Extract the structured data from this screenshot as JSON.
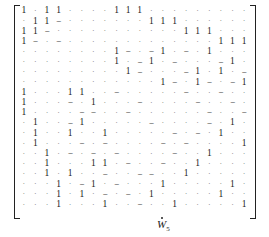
{
  "matrix": {
    "label_base": "W",
    "label_sub": "5",
    "label_accent": "dot",
    "rows": [
      [
        "1",
        "·",
        "1",
        "1",
        "·",
        "·",
        "·",
        "·",
        "1",
        "1",
        "1",
        "·",
        "·",
        "·",
        "·",
        "·",
        "·",
        "·",
        "·",
        "·"
      ],
      [
        "·",
        "1",
        "1",
        "−",
        "·",
        "·",
        "·",
        "·",
        "·",
        "·",
        "·",
        "1",
        "1",
        "1",
        "·",
        "·",
        "·",
        "·",
        "·",
        "·"
      ],
      [
        "1",
        "1",
        "−",
        "·",
        "·",
        "·",
        "·",
        "·",
        "·",
        "·",
        "·",
        "·",
        "·",
        "·",
        "1",
        "1",
        "1",
        "·",
        "·",
        "·"
      ],
      [
        "1",
        "−",
        "·",
        "−",
        "·",
        "·",
        "·",
        "·",
        "·",
        "·",
        "·",
        "·",
        "·",
        "·",
        "·",
        "·",
        "·",
        "1",
        "1",
        "1"
      ],
      [
        "·",
        "·",
        "·",
        "·",
        "·",
        "·",
        "·",
        "·",
        "1",
        "−",
        "·",
        "−",
        "1",
        "·",
        "−",
        "·",
        "1",
        "·",
        "·",
        "·"
      ],
      [
        "·",
        "·",
        "·",
        "·",
        "·",
        "·",
        "·",
        "·",
        "1",
        "·",
        "−",
        "1",
        "·",
        "−",
        "·",
        "·",
        "·",
        "−",
        "1",
        "·"
      ],
      [
        "·",
        "·",
        "·",
        "·",
        "·",
        "·",
        "·",
        "·",
        "·",
        "1",
        "−",
        "·",
        "·",
        "·",
        "−",
        "1",
        "·",
        "1",
        "·",
        "−"
      ],
      [
        "·",
        "·",
        "·",
        "·",
        "·",
        "·",
        "·",
        "·",
        "·",
        "·",
        "·",
        "·",
        "1",
        "−",
        "·",
        "1",
        "−",
        "·",
        "−",
        "1"
      ],
      [
        "1",
        "·",
        "·",
        "·",
        "1",
        "1",
        "·",
        "·",
        "−",
        "·",
        "·",
        "·",
        "·",
        "·",
        "−",
        "·",
        "·",
        "−",
        "·",
        "·"
      ],
      [
        "1",
        "·",
        "·",
        "·",
        "−",
        "·",
        "1",
        "·",
        "·",
        "·",
        "−",
        "·",
        "·",
        "·",
        "·",
        "−",
        "·",
        "·",
        "−",
        "·"
      ],
      [
        "1",
        "·",
        "·",
        "·",
        "·",
        "−",
        "−",
        "·",
        "·",
        "−",
        "·",
        "·",
        "·",
        "·",
        "·",
        "·",
        "−",
        "·",
        "·",
        "−"
      ],
      [
        "·",
        "1",
        "·",
        "·",
        "−",
        "1",
        "·",
        "·",
        "·",
        "·",
        "·",
        "−",
        "·",
        "·",
        "·",
        "·",
        "−",
        "·",
        "1",
        "·"
      ],
      [
        "·",
        "1",
        "·",
        "·",
        "1",
        "·",
        "·",
        "1",
        "·",
        "·",
        "·",
        "·",
        "·",
        "−",
        "·",
        "−",
        "·",
        "1",
        "·",
        "·"
      ],
      [
        "·",
        "1",
        "·",
        "·",
        "·",
        "−",
        "·",
        "−",
        "·",
        "·",
        "·",
        "·",
        "−",
        "·",
        "−",
        "·",
        "·",
        "·",
        "·",
        "1"
      ],
      [
        "·",
        "·",
        "1",
        "·",
        "−",
        "·",
        "−",
        "·",
        "−",
        "·",
        "·",
        "·",
        "·",
        "−",
        "·",
        "·",
        "1",
        "·",
        "·",
        "·"
      ],
      [
        "·",
        "·",
        "1",
        "·",
        "·",
        "·",
        "1",
        "1",
        "·",
        "−",
        "·",
        "·",
        "−",
        "·",
        "·",
        "1",
        "·",
        "·",
        "·",
        "·"
      ],
      [
        "·",
        "·",
        "1",
        "·",
        "1",
        "·",
        "·",
        "−",
        "·",
        "·",
        "−",
        "−",
        "·",
        "·",
        "1",
        "·",
        "·",
        "·",
        "·",
        "·"
      ],
      [
        "·",
        "·",
        "·",
        "1",
        "·",
        "−",
        "1",
        "·",
        "−",
        "·",
        "·",
        "·",
        "1",
        "·",
        "·",
        "·",
        "·",
        "·",
        "1",
        "·"
      ],
      [
        "·",
        "·",
        "·",
        "1",
        "·",
        "1",
        "·",
        "−",
        "·",
        "−",
        "·",
        "1",
        "·",
        "·",
        "·",
        "·",
        "·",
        "1",
        "·",
        "·"
      ],
      [
        "·",
        "·",
        "·",
        "1",
        "·",
        "·",
        "·",
        "1",
        "·",
        "·",
        "−",
        "·",
        "·",
        "1",
        "·",
        "·",
        "·",
        "·",
        "·",
        "1"
      ]
    ]
  }
}
